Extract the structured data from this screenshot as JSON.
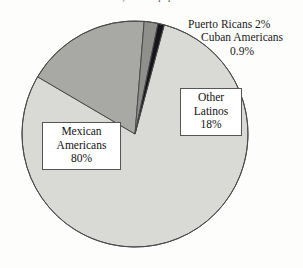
{
  "figure": {
    "title_partial": "1989, 20% of population",
    "background_color": "#fdfdfc"
  },
  "labels": {
    "mexican": {
      "line1": "Mexican",
      "line2": "Americans",
      "line3": "80%"
    },
    "other_latinos": {
      "line1": "Other",
      "line2": "Latinos",
      "line3": "18%"
    },
    "puerto_ricans": {
      "text": "Puerto Ricans 2%"
    },
    "cuban_americans": {
      "line1": "Cuban Americans",
      "line2": "0.9%"
    }
  },
  "chart_data": {
    "type": "pie",
    "title": "1989, 20% of population",
    "labels": [
      "Mexican Americans",
      "Other Latinos",
      "Puerto Ricans",
      "Cuban Americans"
    ],
    "values": [
      80,
      18,
      2,
      0.9
    ],
    "value_strings": [
      "80%",
      "18%",
      "2%",
      "0.9%"
    ],
    "colors": [
      "#d9d9d6",
      "#a8a8a5",
      "#8f8f8c",
      "#15151a"
    ],
    "unit": "percent",
    "legend": "none",
    "label_placement": "callout-boxes-and-external-text",
    "start_angle_deg": -75,
    "direction": "clockwise",
    "outline_color": "#4a4a4a"
  }
}
